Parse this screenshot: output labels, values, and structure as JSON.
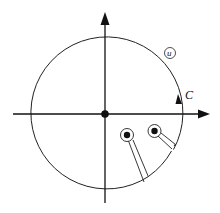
{
  "diagram": {
    "type": "complex-plane contour with keyhole indentations",
    "contour_label": "C",
    "region_label": "u",
    "elements": {
      "contour": "circle centered at origin",
      "axes": [
        "real-axis",
        "imaginary-axis"
      ],
      "origin_point": "filled dot at origin",
      "singularities": 2,
      "branch_cuts": 2,
      "orientation": "counterclockwise arrow on contour"
    }
  }
}
